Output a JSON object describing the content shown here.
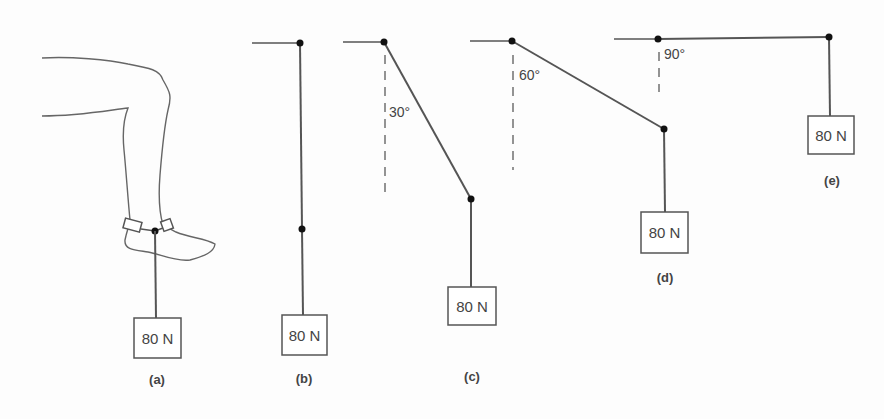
{
  "figure": {
    "panels": [
      {
        "id": "a",
        "caption": "(a)",
        "weight_label": "80 N",
        "description": "leg with ankle weight"
      },
      {
        "id": "b",
        "caption": "(b)",
        "weight_label": "80 N",
        "angle_label": ""
      },
      {
        "id": "c",
        "caption": "(c)",
        "weight_label": "80 N",
        "angle_label": "30°"
      },
      {
        "id": "d",
        "caption": "(d)",
        "weight_label": "80 N",
        "angle_label": "60°"
      },
      {
        "id": "e",
        "caption": "(e)",
        "weight_label": "80 N",
        "angle_label": "90°"
      }
    ],
    "colors": {
      "line": "#555555",
      "joint": "#111111",
      "background": "#fdfdfd"
    }
  }
}
